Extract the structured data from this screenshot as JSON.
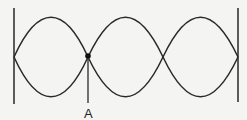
{
  "diagram": {
    "point_label": "A",
    "loops": 3,
    "nodes_x": [
      14,
      88,
      163,
      238
    ],
    "center_y": 57,
    "amplitude": 39,
    "line_color": "#2a2a2a",
    "background": "#f4f4f2"
  }
}
